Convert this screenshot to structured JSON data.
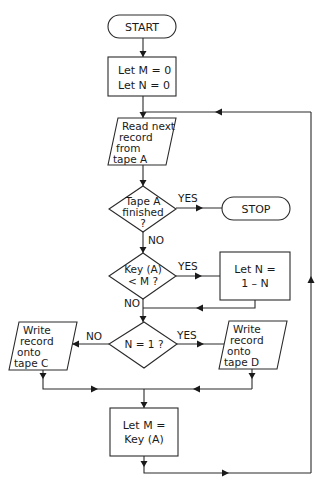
{
  "diagram": {
    "type": "flowchart",
    "nodes": {
      "start": {
        "shape": "terminal",
        "lines": [
          "START"
        ]
      },
      "init": {
        "shape": "process",
        "lines": [
          "Let M = 0",
          "Let N = 0"
        ]
      },
      "read": {
        "shape": "io",
        "lines": [
          "Read next",
          "record",
          "from",
          "tape  A"
        ]
      },
      "finished": {
        "shape": "decision",
        "lines": [
          "Tape A",
          "finished",
          "?"
        ]
      },
      "stop": {
        "shape": "terminal",
        "lines": [
          "STOP"
        ]
      },
      "keycmp": {
        "shape": "decision",
        "lines": [
          "Key (A)",
          "< M ?"
        ]
      },
      "toggle": {
        "shape": "process",
        "lines": [
          "Let  N =",
          "1 – N"
        ]
      },
      "n_eq_1": {
        "shape": "decision",
        "lines": [
          "N = 1 ?"
        ]
      },
      "write_c": {
        "shape": "io",
        "lines": [
          "Write",
          "record",
          "onto",
          "tape  C"
        ]
      },
      "write_d": {
        "shape": "io",
        "lines": [
          "Write",
          "record",
          "onto",
          "tape  D"
        ]
      },
      "set_m": {
        "shape": "process",
        "lines": [
          "Let  M =",
          "Key (A)"
        ]
      }
    },
    "edge_labels": {
      "finished_yes": "YES",
      "finished_no": "NO",
      "keycmp_yes": "YES",
      "keycmp_no": "NO",
      "n_eq_1_no": "NO",
      "n_eq_1_yes": "YES"
    },
    "edges": [
      {
        "from": "start",
        "to": "init"
      },
      {
        "from": "init",
        "to": "read"
      },
      {
        "from": "read",
        "to": "finished"
      },
      {
        "from": "finished",
        "to": "stop",
        "label": "YES"
      },
      {
        "from": "finished",
        "to": "keycmp",
        "label": "NO"
      },
      {
        "from": "keycmp",
        "to": "toggle",
        "label": "YES"
      },
      {
        "from": "keycmp",
        "to": "n_eq_1",
        "label": "NO"
      },
      {
        "from": "toggle",
        "to": "n_eq_1"
      },
      {
        "from": "n_eq_1",
        "to": "write_c",
        "label": "NO"
      },
      {
        "from": "n_eq_1",
        "to": "write_d",
        "label": "YES"
      },
      {
        "from": "write_c",
        "to": "set_m"
      },
      {
        "from": "write_d",
        "to": "set_m"
      },
      {
        "from": "set_m",
        "to": "read"
      }
    ]
  }
}
